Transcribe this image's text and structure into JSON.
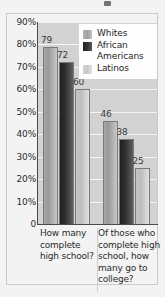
{
  "chart_data": {
    "type": "bar",
    "title": "",
    "xlabel": "",
    "ylabel": "",
    "categories": [
      "How many complete high school?",
      "Of those who complete high school, how many go to college?"
    ],
    "series": [
      {
        "name": "Whites",
        "values": [
          79,
          72
        ]
      },
      {
        "name": "African Americans",
        "values": [
          72,
          38
        ]
      },
      {
        "name": "Latinos",
        "values": [
          60,
          25
        ]
      }
    ],
    "series_corrected": [
      {
        "name": "Whites",
        "values": [
          79,
          46
        ]
      },
      {
        "name": "African Americans",
        "values": [
          72,
          38
        ]
      },
      {
        "name": "Latinos",
        "values": [
          60,
          25
        ]
      }
    ],
    "ylim": [
      0,
      90
    ],
    "ytick_labels": [
      "90%",
      "80%",
      "70%",
      "60%",
      "50%",
      "40%",
      "30%",
      "20%",
      "10%",
      "0"
    ],
    "ytick_values": [
      90,
      80,
      70,
      60,
      50,
      40,
      30,
      20,
      10,
      0
    ],
    "grid": true,
    "legend_position": "upper-right-inside",
    "data_labels": [
      [
        "79",
        "72",
        "60"
      ],
      [
        "46",
        "38",
        "25"
      ]
    ],
    "colors": {
      "whites": "#a8a8a8",
      "african_americans": "#2b2b2b",
      "latinos": "#c8c8c8",
      "plot_background": "#d2d2d2",
      "page_background": "#f3f3f3",
      "gridline": "#f4f4f4",
      "axis": "#4a4a4a",
      "text": "#2b2b2b"
    }
  },
  "legend": {
    "items": [
      {
        "label": "Whites",
        "label_line2": ""
      },
      {
        "label": "African",
        "label_line2": "Americans"
      },
      {
        "label": "Latinos",
        "label_line2": ""
      }
    ]
  },
  "xaxis": {
    "labels": [
      "How many complete high school?",
      "Of those who complete high school, how many go to college?"
    ]
  }
}
